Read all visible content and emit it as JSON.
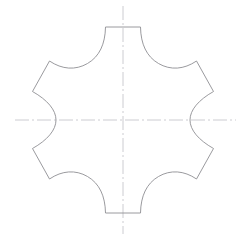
{
  "document": {
    "title": "Six-lobed rosette outline drawing",
    "background_color": "#ffffff",
    "width": 246,
    "height": 240
  },
  "drawing": {
    "type": "technical-line-drawing",
    "name": "six-lobed-rosette",
    "outline": {
      "stroke_color": "#8e8e93",
      "stroke_width": 0.9,
      "fill": "none",
      "lobe_count": 6,
      "description": "Closed profile made of six outward pointed lobes joined by six concave circular arcs; the top and bottom lobes are flattened into short straight chords.",
      "center": {
        "x": 123,
        "y": 120
      },
      "path": "M 105.5 27.0 L 140.5 27.0 C 140.8 44.0 146.5 56.5 158.5 63.5 C 170.5 70.5 184.0 69.5 196.5 61.0 L 213.5 91.5 C 198.5 100.0 190.0 110.0 190.0 120.0 C 190.0 130.0 198.5 140.0 213.5 148.5 L 196.5 179.0 C 184.0 170.5 170.5 169.5 158.5 176.5 C 146.5 183.5 140.8 196.0 140.5 213.0 L 105.5 213.0 C 105.2 196.0 99.5 183.5 87.5 176.5 C 75.5 169.5 62.0 170.5 49.5 179.0 L 32.5 148.5 C 47.5 140.0 56.0 130.0 56.0 120.0 C 56.0 110.0 47.5 100.0 32.5 91.5 L 49.5 61.0 C 62.0 69.5 75.5 70.5 87.5 63.5 C 99.5 56.5 105.2 44.0 105.5 27.0 Z",
      "lobe_tips": [
        {
          "name": "top",
          "x": 123,
          "y": 27,
          "shape": "flattened-chord"
        },
        {
          "name": "upper-right",
          "x": 205,
          "y": 74,
          "shape": "point"
        },
        {
          "name": "lower-right",
          "x": 205,
          "y": 166,
          "shape": "point"
        },
        {
          "name": "bottom",
          "x": 123,
          "y": 213,
          "shape": "flattened-chord"
        },
        {
          "name": "lower-left",
          "x": 41,
          "y": 166,
          "shape": "point"
        },
        {
          "name": "upper-left",
          "x": 41,
          "y": 74,
          "shape": "point"
        }
      ],
      "notch_extremes": [
        {
          "name": "left-notch",
          "x": 56,
          "y": 120
        },
        {
          "name": "right-notch",
          "x": 190,
          "y": 120
        },
        {
          "name": "top-notch",
          "x": 123,
          "y": 27
        },
        {
          "name": "bottom-notch",
          "x": 123,
          "y": 213
        }
      ]
    },
    "centerlines": {
      "stroke_color": "#c6c6cc",
      "stroke_width": 0.9,
      "dash_pattern": "14 3 2 3",
      "vertical": {
        "x": 123,
        "y1": 6,
        "y2": 234
      },
      "horizontal": {
        "y": 120,
        "x1": 15,
        "x2": 236
      }
    }
  }
}
